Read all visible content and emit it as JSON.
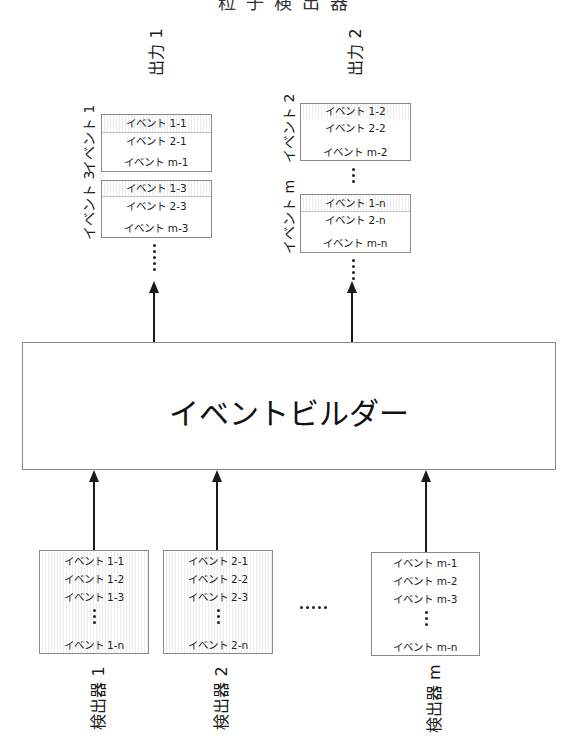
{
  "page_title_clipped": "粒子検出器",
  "outputs": [
    {
      "label": "出力 1",
      "groups": [
        {
          "label": "イベント 1",
          "rows": [
            "イベント 1-1",
            "イベント 2-1",
            "イベント m-1"
          ]
        },
        {
          "label": "イベント 3",
          "rows": [
            "イベント 1-3",
            "イベント 2-3",
            "イベント m-3"
          ]
        }
      ]
    },
    {
      "label": "出力 2",
      "groups": [
        {
          "label": "イベント 2",
          "rows": [
            "イベント 1-2",
            "イベント 2-2",
            "イベント m-2"
          ]
        },
        {
          "label": "イベント m",
          "rows": [
            "イベント 1-n",
            "イベント 2-n",
            "イベント m-n"
          ]
        }
      ]
    }
  ],
  "builder": {
    "label": "イベントビルダー"
  },
  "detectors": [
    {
      "label": "検出器 1",
      "rows": [
        "イベント 1-1",
        "イベント 1-2",
        "イベント 1-3",
        "イベント 1-n"
      ]
    },
    {
      "label": "検出器 2",
      "rows": [
        "イベント 2-1",
        "イベント 2-2",
        "イベント 2-3",
        "イベント 2-n"
      ]
    },
    {
      "label": "検出器 m",
      "rows": [
        "イベント m-1",
        "イベント m-2",
        "イベント m-3",
        "イベント m-n"
      ]
    }
  ],
  "ellipsis": "·····",
  "colors": {
    "line": "#1a1a1a",
    "box_border": "#8a8a8a",
    "hatch": "#ececec"
  }
}
